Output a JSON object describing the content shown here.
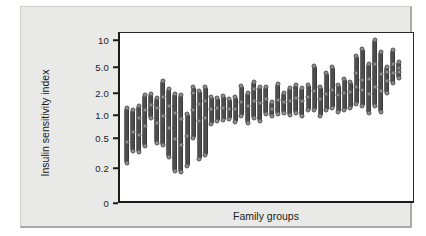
{
  "figure": {
    "background_color": "#e9e9e7",
    "plot_background_color": "#ffffff",
    "axis_color": "#1b1b1b",
    "bar_color": "#4d4d4d",
    "point_color": "#8d8d8d"
  },
  "chart_data": {
    "type": "bar",
    "variant": "range-bar-with-points",
    "title": "",
    "xlabel": "Family groups",
    "ylabel": "Insulin sensitivity index",
    "yscale": "log",
    "ytick_labels": [
      "10",
      "5.0",
      "2.0",
      "1.0",
      "0.5",
      "0.2",
      "0"
    ],
    "ytick_values": [
      10,
      5.0,
      2.0,
      1.0,
      0.5,
      0.2,
      0
    ],
    "ylim": [
      0.15,
      11
    ],
    "grid": false,
    "legend": null,
    "categories": [
      "F1",
      "F2",
      "F3",
      "F4",
      "F5",
      "F6",
      "F7",
      "F8",
      "F9",
      "F10",
      "F11",
      "F12",
      "F13",
      "F14",
      "F15",
      "F16",
      "F17",
      "F18",
      "F19",
      "F20",
      "F21",
      "F22",
      "F23",
      "F24",
      "F25",
      "F26",
      "F27",
      "F28",
      "F29",
      "F30",
      "F31",
      "F32",
      "F33",
      "F34",
      "F35",
      "F36",
      "F37",
      "F38",
      "F39",
      "F40",
      "F41",
      "F42",
      "F43",
      "F44",
      "F45",
      "F46"
    ],
    "series": [
      {
        "name": "min",
        "values": [
          0.24,
          0.35,
          0.34,
          0.4,
          0.93,
          0.44,
          0.41,
          0.29,
          0.19,
          0.18,
          0.22,
          0.52,
          0.27,
          0.31,
          0.78,
          0.85,
          0.89,
          0.9,
          0.83,
          1.0,
          0.8,
          0.95,
          0.85,
          1.05,
          1.0,
          1.05,
          1.1,
          1.02,
          1.1,
          1.0,
          1.2,
          1.22,
          1.0,
          1.2,
          1.3,
          1.15,
          1.2,
          1.3,
          1.45,
          1.35,
          1.1,
          1.35,
          1.15,
          2.05,
          2.95,
          3.5
        ]
      },
      {
        "name": "max",
        "values": [
          1.3,
          1.22,
          1.35,
          1.95,
          2.0,
          1.75,
          3.2,
          2.35,
          2.0,
          1.95,
          1.05,
          2.55,
          2.25,
          2.55,
          1.8,
          1.75,
          1.9,
          1.7,
          1.8,
          2.65,
          2.05,
          3.0,
          2.55,
          2.55,
          1.55,
          2.85,
          2.05,
          2.5,
          2.75,
          2.5,
          2.7,
          5.2,
          2.55,
          4.2,
          5.1,
          2.7,
          3.4,
          3.1,
          6.8,
          8.2,
          5.6,
          10.2,
          7.5,
          5.1,
          8.0,
          5.8
        ]
      }
    ],
    "points": [
      [
        0.24,
        0.45,
        1.3
      ],
      [
        0.35,
        0.62,
        1.22
      ],
      [
        0.34,
        0.56,
        0.95,
        1.35
      ],
      [
        0.4,
        0.75,
        1.2,
        1.95
      ],
      [
        0.93,
        1.4,
        2.0
      ],
      [
        0.44,
        0.8,
        1.3,
        1.75
      ],
      [
        0.41,
        1.0,
        1.8,
        3.2
      ],
      [
        0.29,
        0.7,
        1.35,
        2.35
      ],
      [
        0.19,
        0.5,
        1.1,
        2.0
      ],
      [
        0.18,
        0.42,
        0.9,
        1.95
      ],
      [
        0.22,
        0.55,
        1.05
      ],
      [
        0.52,
        1.2,
        2.1,
        2.55
      ],
      [
        0.27,
        0.85,
        1.45,
        2.25
      ],
      [
        0.31,
        0.95,
        1.6,
        2.55
      ],
      [
        0.78,
        1.25,
        1.8
      ],
      [
        0.85,
        1.3,
        1.75
      ],
      [
        0.89,
        1.3,
        1.9
      ],
      [
        0.9,
        1.25,
        1.7
      ],
      [
        0.83,
        1.25,
        1.8
      ],
      [
        1.0,
        1.55,
        2.65
      ],
      [
        0.8,
        1.35,
        2.05
      ],
      [
        0.95,
        1.6,
        2.35,
        3.0
      ],
      [
        0.85,
        1.5,
        2.55
      ],
      [
        1.05,
        1.7,
        2.55
      ],
      [
        1.0,
        1.25,
        1.55
      ],
      [
        1.05,
        1.65,
        2.85
      ],
      [
        1.1,
        1.55,
        2.05
      ],
      [
        1.02,
        1.6,
        2.5
      ],
      [
        1.1,
        1.75,
        2.75
      ],
      [
        1.0,
        1.6,
        2.5
      ],
      [
        1.2,
        1.8,
        2.7
      ],
      [
        1.22,
        2.2,
        5.2
      ],
      [
        1.0,
        1.7,
        2.55
      ],
      [
        1.2,
        2.0,
        4.2
      ],
      [
        1.3,
        2.3,
        5.1
      ],
      [
        1.15,
        1.95,
        2.7
      ],
      [
        1.2,
        2.1,
        3.4
      ],
      [
        1.3,
        2.15,
        3.1
      ],
      [
        1.45,
        2.6,
        4.2,
        6.8
      ],
      [
        1.35,
        2.3,
        3.3,
        8.2
      ],
      [
        1.1,
        2.0,
        3.4,
        5.6
      ],
      [
        1.35,
        2.55,
        5.5,
        10.2
      ],
      [
        1.15,
        2.2,
        4.1,
        7.5
      ],
      [
        2.05,
        3.15,
        4.3,
        5.1
      ],
      [
        2.95,
        4.2,
        5.6,
        8.0
      ],
      [
        3.5,
        4.4,
        5.0,
        5.8
      ]
    ]
  }
}
